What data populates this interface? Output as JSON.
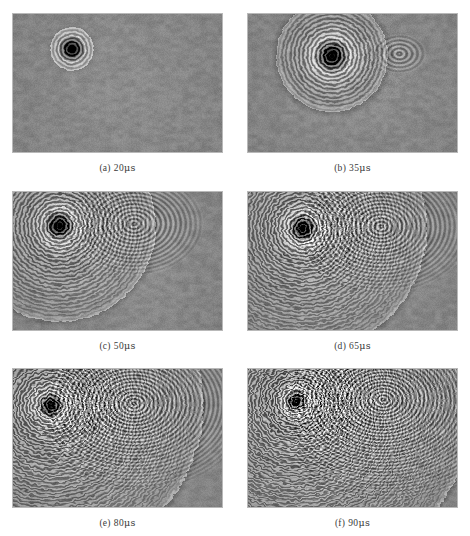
{
  "figure": {
    "type": "schlieren-shadowgraph-sequence",
    "background_color": "#8a8a8a",
    "page_background": "#ffffff",
    "frame_border_color": "#b9b9b9",
    "rows": 3,
    "columns": 2,
    "panels": [
      {
        "id": "a",
        "label": "(a)",
        "time_value": "20",
        "time_unit": "μs",
        "caption": "(a) 20μs",
        "source_x": 0.28,
        "source_y": 0.25,
        "wave_radius": 0.14,
        "ring_count": 5,
        "ring_spacing": 0.026,
        "amplitude": 0.62,
        "core_radius": 0.035,
        "secondary_front": 0.0,
        "turbulence": 0.0,
        "ring_phase": 0.0
      },
      {
        "id": "b",
        "label": "(b)",
        "time_value": "35",
        "time_unit": "μs",
        "caption": "(b) 35μs",
        "source_x": 0.4,
        "source_y": 0.3,
        "wave_radius": 0.36,
        "ring_count": 13,
        "ring_spacing": 0.027,
        "amplitude": 0.7,
        "core_radius": 0.045,
        "secondary_front": 0.1,
        "turbulence": 0.1,
        "ring_phase": 0.2
      },
      {
        "id": "c",
        "label": "(c)",
        "time_value": "50",
        "time_unit": "μs",
        "caption": "(c) 50μs",
        "source_x": 0.22,
        "source_y": 0.24,
        "wave_radius": 0.62,
        "ring_count": 24,
        "ring_spacing": 0.025,
        "amplitude": 0.72,
        "core_radius": 0.04,
        "secondary_front": 0.26,
        "turbulence": 0.22,
        "ring_phase": 0.5
      },
      {
        "id": "d",
        "label": "(d)",
        "time_value": "65",
        "time_unit": "μs",
        "caption": "(d) 65μs",
        "source_x": 0.26,
        "source_y": 0.26,
        "wave_radius": 0.8,
        "ring_count": 32,
        "ring_spacing": 0.024,
        "amplitude": 0.74,
        "core_radius": 0.038,
        "secondary_front": 0.34,
        "turbulence": 0.34,
        "ring_phase": 0.8
      },
      {
        "id": "e",
        "label": "(e)",
        "time_value": "80",
        "time_unit": "μs",
        "caption": "(e) 80μs",
        "source_x": 0.18,
        "source_y": 0.26,
        "wave_radius": 0.98,
        "ring_count": 40,
        "ring_spacing": 0.023,
        "amplitude": 0.78,
        "core_radius": 0.034,
        "secondary_front": 0.44,
        "turbulence": 0.46,
        "ring_phase": 1.1
      },
      {
        "id": "f",
        "label": "(f)",
        "time_value": "90",
        "time_unit": "μs",
        "caption": "(f) 90μs",
        "source_x": 0.23,
        "source_y": 0.23,
        "wave_radius": 1.14,
        "ring_count": 48,
        "ring_spacing": 0.022,
        "amplitude": 0.82,
        "core_radius": 0.03,
        "secondary_front": 0.52,
        "turbulence": 0.58,
        "ring_phase": 1.4
      }
    ]
  }
}
